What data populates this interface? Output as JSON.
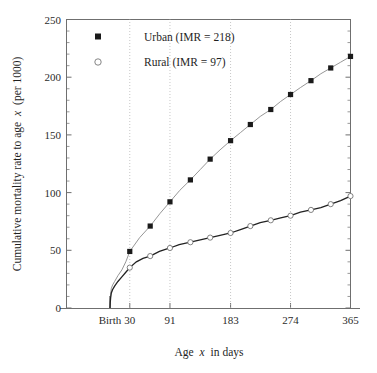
{
  "chart_data": {
    "type": "line",
    "title": "",
    "xlabel": "Age x in days",
    "ylabel": "Cumulative mortality rate to age x (per 1000)",
    "xlim": [
      0,
      365
    ],
    "ylim": [
      0,
      250
    ],
    "grid": "vertical-dotted-at-major-x-ticks",
    "legend_position": "top-left-inside",
    "x_tick_labels": [
      "Birth",
      "30",
      "91",
      "183",
      "274",
      "365"
    ],
    "x_tick_values": [
      0,
      30,
      91,
      183,
      274,
      365
    ],
    "y_tick_labels": [
      "0",
      "50",
      "100",
      "150",
      "200",
      "250"
    ],
    "y_tick_values": [
      0,
      50,
      100,
      150,
      200,
      250
    ],
    "y_minor_tick_step": 10,
    "series": [
      {
        "name": "Urban (IMR = 218)",
        "marker": "filled-square",
        "color": "#1a1a1a",
        "x": [
          30,
          61,
          91,
          122,
          152,
          183,
          213,
          244,
          274,
          305,
          335,
          365
        ],
        "values": [
          49,
          71,
          92,
          111,
          129,
          145,
          159,
          172,
          185,
          197,
          208,
          218
        ]
      },
      {
        "name": "Rural (IMR = 97)",
        "marker": "open-circle",
        "color": "#555555",
        "x": [
          30,
          61,
          91,
          122,
          152,
          183,
          213,
          244,
          274,
          305,
          335,
          365
        ],
        "values": [
          35,
          45,
          52,
          57,
          61,
          65,
          71,
          76,
          80,
          85,
          90,
          97
        ]
      }
    ],
    "urban_curve": [
      [
        0,
        0
      ],
      [
        0.4,
        6
      ],
      [
        1,
        12
      ],
      [
        2,
        17
      ],
      [
        4,
        20
      ],
      [
        7,
        23
      ],
      [
        12,
        28
      ],
      [
        18,
        33
      ],
      [
        24,
        40
      ],
      [
        30,
        49
      ],
      [
        45,
        61
      ],
      [
        61,
        71
      ],
      [
        76,
        82
      ],
      [
        91,
        92
      ],
      [
        106,
        102
      ],
      [
        122,
        111
      ],
      [
        137,
        120
      ],
      [
        152,
        129
      ],
      [
        167,
        137
      ],
      [
        183,
        145
      ],
      [
        198,
        152
      ],
      [
        213,
        159
      ],
      [
        228,
        166
      ],
      [
        244,
        172
      ],
      [
        259,
        179
      ],
      [
        274,
        185
      ],
      [
        289,
        191
      ],
      [
        305,
        197
      ],
      [
        320,
        203
      ],
      [
        335,
        208
      ],
      [
        350,
        213
      ],
      [
        365,
        218
      ]
    ],
    "rural_curve": [
      [
        0,
        0
      ],
      [
        0.4,
        5
      ],
      [
        1,
        9
      ],
      [
        2,
        13
      ],
      [
        4,
        16
      ],
      [
        7,
        19
      ],
      [
        12,
        23
      ],
      [
        18,
        27
      ],
      [
        24,
        31
      ],
      [
        30,
        35
      ],
      [
        40,
        40
      ],
      [
        50,
        43
      ],
      [
        61,
        45
      ],
      [
        75,
        49
      ],
      [
        91,
        52
      ],
      [
        105,
        55
      ],
      [
        122,
        57
      ],
      [
        137,
        59
      ],
      [
        152,
        61
      ],
      [
        167,
        63
      ],
      [
        183,
        65
      ],
      [
        198,
        68
      ],
      [
        213,
        71
      ],
      [
        228,
        74
      ],
      [
        244,
        76
      ],
      [
        259,
        78
      ],
      [
        274,
        80
      ],
      [
        289,
        83
      ],
      [
        305,
        85
      ],
      [
        320,
        87
      ],
      [
        335,
        90
      ],
      [
        350,
        93
      ],
      [
        365,
        97
      ]
    ]
  },
  "legend": {
    "entries": [
      {
        "label": "Urban (IMR = 218)",
        "marker": "filled-square"
      },
      {
        "label": "Rural (IMR = 97)",
        "marker": "open-circle"
      }
    ]
  },
  "axes": {
    "y_title_pre": "Cumulative mortality rate to age",
    "y_title_ital": "x",
    "y_title_post": "(per 1000)",
    "x_title_pre": "Age",
    "x_title_ital": "x",
    "x_title_post": "in days"
  },
  "colors": {
    "axis": "#6f6f6f",
    "urban": "#1a1a1a",
    "rural": "#4a4a4a",
    "grid": "#b9b9b9",
    "text": "#1f1f1f",
    "background": "#ffffff"
  }
}
